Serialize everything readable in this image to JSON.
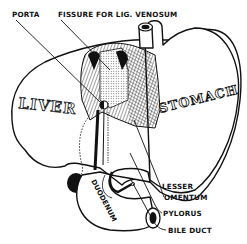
{
  "diagram": {
    "organs": {
      "liver": "LIVER",
      "stomach": "STOMACH",
      "duodenum": "DUODENUM"
    },
    "labels": {
      "porta": "PORTA",
      "fissure": "FISSURE FOR LIG. VENOSUM",
      "lesser": "LESSER",
      "omentum": "OMENTUM",
      "pylorus": "PYLORUS",
      "bile_duct": "BILE DUCT"
    },
    "colors": {
      "ink": "#111111",
      "background": "#ffffff"
    }
  }
}
